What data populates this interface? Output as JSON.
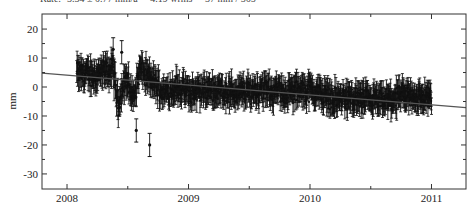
{
  "header": {
    "text": "Rate: -3.34 ± 0.77 mm/a     4.19 wrms     37 mm / 365"
  },
  "chart_data": {
    "type": "scatter",
    "title": "",
    "xlabel": "",
    "ylabel": "mm",
    "xlim": [
      2007.794,
      2011.284
    ],
    "ylim": [
      -35.2,
      25.2
    ],
    "x_ticks": [
      2008,
      2009,
      2010,
      2011
    ],
    "x_tick_labels": [
      "2008",
      "2009",
      "2010",
      "2011"
    ],
    "x_minor_ticks": [
      2008.5,
      2009.5,
      2010.5
    ],
    "y_ticks": [
      20,
      10,
      0,
      -10,
      -20,
      -30
    ],
    "y_tick_labels": [
      "20",
      "10",
      "0",
      "-10",
      "-20",
      "-30"
    ],
    "y_minor_ticks": [
      15,
      5,
      -5,
      -15,
      -25
    ],
    "grid": false,
    "legend": null,
    "error_bars": true,
    "series": [
      {
        "name": "daily positions",
        "style": "black filled circles with vertical error bars",
        "x_range": [
          2008.08,
          2011.0
        ],
        "approx_error_bar_halfwidth_mm": 3.5,
        "envelope": [
          {
            "x": 2008.1,
            "y": 5
          },
          {
            "x": 2008.2,
            "y": 4
          },
          {
            "x": 2008.3,
            "y": 5
          },
          {
            "x": 2008.38,
            "y": 6
          },
          {
            "x": 2008.42,
            "y": -6
          },
          {
            "x": 2008.48,
            "y": 3
          },
          {
            "x": 2008.55,
            "y": -4
          },
          {
            "x": 2008.6,
            "y": 6
          },
          {
            "x": 2008.7,
            "y": 2
          },
          {
            "x": 2008.8,
            "y": -2
          },
          {
            "x": 2008.9,
            "y": 0
          },
          {
            "x": 2009.0,
            "y": -2
          },
          {
            "x": 2009.2,
            "y": -1
          },
          {
            "x": 2009.4,
            "y": -2
          },
          {
            "x": 2009.6,
            "y": -1
          },
          {
            "x": 2009.8,
            "y": -2
          },
          {
            "x": 2010.0,
            "y": -1
          },
          {
            "x": 2010.2,
            "y": -4
          },
          {
            "x": 2010.4,
            "y": -4
          },
          {
            "x": 2010.6,
            "y": -5
          },
          {
            "x": 2010.8,
            "y": -3
          },
          {
            "x": 2011.0,
            "y": -4
          }
        ],
        "outliers": [
          {
            "x": 2008.57,
            "y": -15
          },
          {
            "x": 2008.68,
            "y": -20
          },
          {
            "x": 2008.45,
            "y": 12
          },
          {
            "x": 2008.38,
            "y": 13
          }
        ]
      },
      {
        "name": "linear trend",
        "style": "gray line",
        "points": [
          {
            "x": 2007.794,
            "y": 4.8
          },
          {
            "x": 2011.284,
            "y": -7.1
          }
        ]
      }
    ]
  },
  "colors": {
    "data": "#111111",
    "trend": "#555555",
    "axis": "#333333",
    "background": "#ffffff"
  }
}
